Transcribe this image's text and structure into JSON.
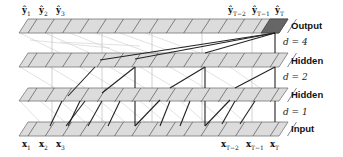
{
  "diagram": {
    "type": "dilated causal convolution (WaveNet/TCN style)",
    "layers": [
      {
        "name": "output",
        "label": "Output",
        "y_top": 19,
        "dilation_label": "d = 4"
      },
      {
        "name": "hidden-2",
        "label": "Hidden",
        "y_top": 53,
        "dilation_label": "d = 2"
      },
      {
        "name": "hidden-1",
        "label": "Hidden",
        "y_top": 88,
        "dilation_label": "d = 1"
      },
      {
        "name": "input",
        "label": "Input",
        "y_top": 122,
        "dilation_label": ""
      }
    ],
    "top_labels": {
      "y1": "ŷ",
      "y1_sub": "1",
      "y2": "ŷ",
      "y2_sub": "2",
      "y3": "ŷ",
      "y3_sub": "3",
      "yT2": "ŷ",
      "yT2_sub": "T−2",
      "yT1": "ŷ",
      "yT1_sub": "T−1",
      "yT": "ŷ",
      "yT_sub": "T"
    },
    "bottom_labels": {
      "x1": "x",
      "x1_sub": "1",
      "x2": "x",
      "x2_sub": "2",
      "x3": "x",
      "x3_sub": "3",
      "xT2": "x",
      "xT2_sub": "T−2",
      "xT1": "x",
      "xT1_sub": "T−1",
      "xT": "x",
      "xT_sub": "T"
    },
    "side_labels": {
      "output": "Output",
      "d4": "d = 4",
      "hidden_upper": "Hidden",
      "d2": "d = 2",
      "hidden_lower": "Hidden",
      "d1": "d = 1",
      "input": "Input"
    },
    "colors": {
      "band_fill": "#d9d9d9",
      "band_stroke": "#7a7a7a",
      "highlight_cell": "#6b6b6b",
      "active_edge": "#2a2a2a",
      "faint_edge": "#c8c8c8"
    }
  }
}
